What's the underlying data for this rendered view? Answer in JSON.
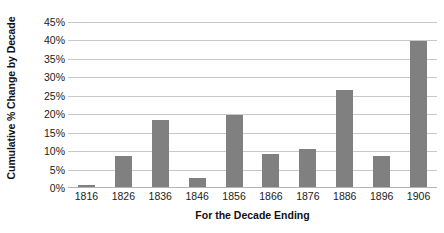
{
  "chart_data": {
    "type": "bar",
    "title": "",
    "subtitle": "",
    "xlabel": "For the Decade Ending",
    "ylabel": "Cumulative % Change by Decade",
    "categories": [
      "1816",
      "1826",
      "1836",
      "1846",
      "1856",
      "1866",
      "1876",
      "1886",
      "1896",
      "1906"
    ],
    "values": [
      0.5,
      8.4,
      18.2,
      2.4,
      19.6,
      9.0,
      10.2,
      26.4,
      8.4,
      39.6
    ],
    "ylim": [
      0,
      45
    ],
    "ytick_step": 5,
    "ytick_labels": [
      "0%",
      "5%",
      "10%",
      "15%",
      "20%",
      "25%",
      "30%",
      "35%",
      "40%",
      "45%"
    ],
    "ytick_values": [
      0,
      5,
      10,
      15,
      20,
      25,
      30,
      35,
      40,
      45
    ],
    "value_suffix": "%",
    "grid": true,
    "grid_axis": "y",
    "legend": false,
    "legend_position": "none",
    "bar_color": "#808080",
    "grid_color": "#c8c8c8",
    "axis_color": "#b4b4b4",
    "background_color": "#ffffff",
    "text_color": "#1a1a1a"
  }
}
